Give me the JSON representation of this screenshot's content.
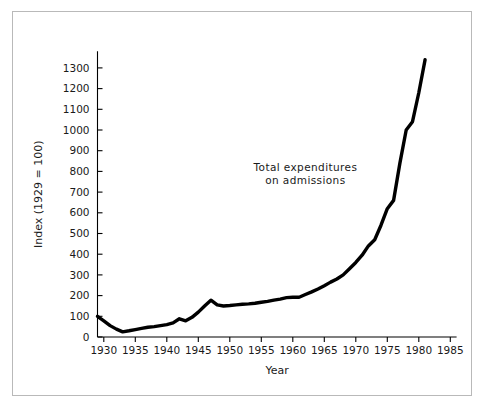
{
  "chart_data": {
    "type": "line",
    "title": "",
    "xlabel": "Year",
    "ylabel": "Index (1929 = 100)",
    "xlim": [
      1929,
      1986
    ],
    "ylim": [
      0,
      1380
    ],
    "grid": false,
    "legend": null,
    "annotations": [
      {
        "name": "series-annotation",
        "lines": [
          "Total expenditures",
          "on admissions"
        ],
        "x": 1962,
        "y": 800
      }
    ],
    "xticks": [
      1930,
      1935,
      1940,
      1945,
      1950,
      1955,
      1960,
      1965,
      1970,
      1975,
      1980,
      1985
    ],
    "xtick_labels": [
      "1930",
      "1935",
      "1940",
      "1945",
      "1950",
      "1955",
      "1960",
      "1965",
      "1970",
      "1975",
      "1980",
      "1985"
    ],
    "yticks": [
      0,
      100,
      200,
      300,
      400,
      500,
      600,
      700,
      800,
      900,
      1000,
      1100,
      1200,
      1300
    ],
    "ytick_labels": [
      "0",
      "100",
      "200",
      "300",
      "400",
      "500",
      "600",
      "700",
      "800",
      "900",
      "1000",
      "1100",
      "1200",
      "1300"
    ],
    "series": [
      {
        "name": "Total expenditures on admissions",
        "color": "#000000",
        "x": [
          1929,
          1930,
          1931,
          1932,
          1933,
          1934,
          1935,
          1936,
          1937,
          1938,
          1939,
          1940,
          1941,
          1942,
          1943,
          1944,
          1945,
          1946,
          1947,
          1948,
          1949,
          1950,
          1951,
          1952,
          1953,
          1954,
          1955,
          1956,
          1957,
          1958,
          1959,
          1960,
          1961,
          1962,
          1963,
          1964,
          1965,
          1966,
          1967,
          1968,
          1969,
          1970,
          1971,
          1972,
          1973,
          1974,
          1975,
          1976,
          1977,
          1978,
          1979,
          1980,
          1981
        ],
        "values": [
          100,
          78,
          55,
          38,
          25,
          30,
          36,
          42,
          47,
          50,
          55,
          60,
          68,
          88,
          78,
          95,
          120,
          150,
          178,
          155,
          150,
          152,
          155,
          158,
          160,
          163,
          168,
          172,
          178,
          183,
          190,
          192,
          192,
          205,
          218,
          232,
          248,
          265,
          280,
          300,
          330,
          360,
          395,
          440,
          470,
          540,
          620,
          660,
          840,
          1000,
          1040,
          1180,
          1340
        ]
      }
    ]
  },
  "axes": {
    "x_axis_name": "x-axis",
    "y_axis_name": "y-axis"
  }
}
